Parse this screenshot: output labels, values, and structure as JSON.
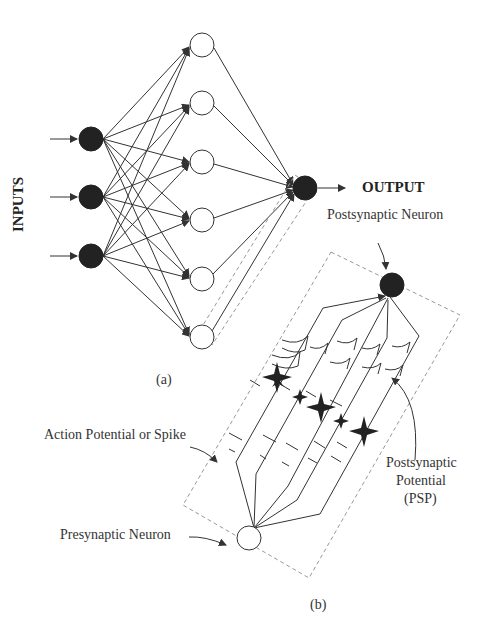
{
  "panel_a": {
    "caption": "(a)",
    "inputs_label": "INPUTS",
    "output_label": "OUTPUT",
    "input_neurons": [
      {
        "x": 91,
        "y": 139
      },
      {
        "x": 91,
        "y": 197
      },
      {
        "x": 91,
        "y": 256
      }
    ],
    "hidden_neurons": [
      {
        "x": 202,
        "y": 45
      },
      {
        "x": 202,
        "y": 103
      },
      {
        "x": 202,
        "y": 162
      },
      {
        "x": 202,
        "y": 220
      },
      {
        "x": 202,
        "y": 279
      },
      {
        "x": 202,
        "y": 337
      }
    ],
    "output_neuron": {
      "x": 305,
      "y": 188
    }
  },
  "panel_b": {
    "caption": "(b)",
    "postsynaptic_label": "Postsynaptic Neuron",
    "presynaptic_label": "Presynaptic Neuron",
    "spike_label": "Action Potential or Spike",
    "psp_label_lines": [
      "Postsynaptic",
      "Potential",
      "(PSP)"
    ],
    "postsynaptic_neuron": {
      "x": 392,
      "y": 285
    },
    "presynaptic_neuron": {
      "x": 249,
      "y": 538
    }
  },
  "colors": {
    "line": "#333333",
    "filled_neuron": "#222222",
    "dashed_box": "#999999",
    "text": "#333333"
  }
}
